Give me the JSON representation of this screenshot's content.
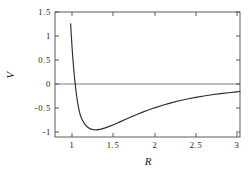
{
  "chart_data": {
    "type": "line",
    "title": "",
    "subtitle": "",
    "xlabel": "R",
    "ylabel": "V",
    "xlim": [
      0.79,
      3.04
    ],
    "ylim": [
      -1.11,
      1.5
    ],
    "grid": false,
    "legend": null,
    "xticks": [
      1,
      1.5,
      2,
      2.5,
      3
    ],
    "xtick_labels": [
      "1",
      "1.5",
      "2",
      "2.5",
      "3"
    ],
    "yticks": [
      1.5,
      1,
      0.5,
      0,
      -0.5,
      -1
    ],
    "ytick_labels": [
      "1.5",
      "1",
      "0.5",
      "0",
      "-0.5",
      "-1"
    ],
    "series": [
      {
        "name": "Lennard-Jones potential",
        "color": "#2b2b2b",
        "description": "V = (Rm/R)^12 - 2 (Rm/R)^6 with Rm = 1.122, well depth -1 at R = 1.122, zero crossing at R = 1.0",
        "x": [
          0.96,
          0.97,
          0.98,
          0.99,
          1.0,
          1.01,
          1.02,
          1.03,
          1.04,
          1.05,
          1.06,
          1.07,
          1.08,
          1.09,
          1.1,
          1.122,
          1.15,
          1.18,
          1.22,
          1.26,
          1.3,
          1.35,
          1.4,
          1.45,
          1.5,
          1.55,
          1.6,
          1.65,
          1.7,
          1.75,
          1.8,
          1.85,
          1.9,
          1.95,
          2.0,
          2.1,
          2.2,
          2.3,
          2.4,
          2.5,
          2.6,
          2.7,
          2.8,
          2.9,
          3.0,
          3.04
        ],
        "y": [
          1.955,
          1.585,
          1.255,
          0.961,
          0.7,
          0.469,
          0.264,
          0.084,
          -0.074,
          -0.212,
          -0.333,
          -0.437,
          -0.527,
          -0.603,
          -0.667,
          -0.754,
          -0.838,
          -0.896,
          -0.941,
          -0.959,
          -0.96,
          -0.945,
          -0.92,
          -0.888,
          -0.853,
          -0.816,
          -0.778,
          -0.74,
          -0.702,
          -0.665,
          -0.629,
          -0.595,
          -0.562,
          -0.531,
          -0.501,
          -0.446,
          -0.397,
          -0.354,
          -0.316,
          -0.283,
          -0.254,
          -0.228,
          -0.205,
          -0.185,
          -0.167,
          -0.16
        ],
        "minimum": {
          "x": 1.122,
          "y": -1.0
        },
        "zero_crossing": {
          "x": 1.0,
          "y": 0.0
        },
        "asymptote": 0.0
      }
    ]
  },
  "axes": {
    "y_title": "V",
    "x_title": "R"
  }
}
